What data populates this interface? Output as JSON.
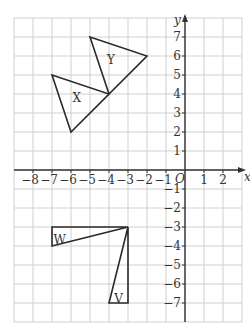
{
  "diagram": {
    "type": "coordinate-grid-transformations",
    "x_range": [
      -9,
      3
    ],
    "y_range": [
      -8,
      8
    ],
    "axis_labels": {
      "x": "x",
      "y": "y",
      "origin": "O"
    },
    "x_ticks": [
      {
        "v": -8,
        "label": "−8"
      },
      {
        "v": -7,
        "label": "−7"
      },
      {
        "v": -6,
        "label": "−6"
      },
      {
        "v": -5,
        "label": "−5"
      },
      {
        "v": -4,
        "label": "−4"
      },
      {
        "v": -3,
        "label": "−3"
      },
      {
        "v": -2,
        "label": "−2"
      },
      {
        "v": -1,
        "label": "−1"
      },
      {
        "v": 1,
        "label": "1"
      },
      {
        "v": 2,
        "label": "2"
      }
    ],
    "y_ticks": [
      {
        "v": 7,
        "label": "7"
      },
      {
        "v": 6,
        "label": "6"
      },
      {
        "v": 5,
        "label": "5"
      },
      {
        "v": 4,
        "label": "4"
      },
      {
        "v": 3,
        "label": "3"
      },
      {
        "v": 2,
        "label": "2"
      },
      {
        "v": 1,
        "label": "1"
      },
      {
        "v": -1,
        "label": "−1"
      },
      {
        "v": -2,
        "label": "−2"
      },
      {
        "v": -3,
        "label": "−3"
      },
      {
        "v": -4,
        "label": "−4"
      },
      {
        "v": -5,
        "label": "−5"
      },
      {
        "v": -6,
        "label": "−6"
      },
      {
        "v": -7,
        "label": "−7"
      }
    ],
    "shapes": [
      {
        "name": "X",
        "vertices": [
          [
            -7,
            5
          ],
          [
            -4,
            4
          ],
          [
            -6,
            2
          ]
        ],
        "label_pos": [
          -5.7,
          3.8
        ]
      },
      {
        "name": "Y",
        "vertices": [
          [
            -5,
            7
          ],
          [
            -2,
            6
          ],
          [
            -4,
            4
          ]
        ],
        "label_pos": [
          -3.9,
          5.8
        ]
      },
      {
        "name": "W",
        "vertices": [
          [
            -7,
            -3
          ],
          [
            -3,
            -3
          ],
          [
            -7,
            -4
          ]
        ],
        "label_pos": [
          -6.6,
          -3.7
        ]
      },
      {
        "name": "V",
        "vertices": [
          [
            -3,
            -3
          ],
          [
            -3,
            -7
          ],
          [
            -4,
            -7
          ]
        ],
        "label_pos": [
          -3.5,
          -6.8
        ]
      }
    ],
    "colors": {
      "grid": "#cfcfcf",
      "axis": "#333333",
      "shape_stroke": "#2a2a2a"
    }
  }
}
